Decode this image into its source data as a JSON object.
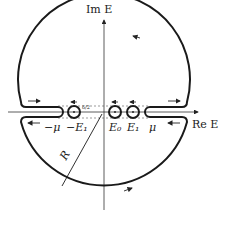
{
  "diagram": {
    "axes": {
      "imaginary_label": "Im E",
      "real_label": "Re E"
    },
    "points_labels": {
      "minus_mu": "−μ",
      "minus_E1": "−E₁",
      "E0": "E₀",
      "E1": "E₁",
      "mu": "μ"
    },
    "radius_label": "R",
    "gap_label": "δ/2",
    "colors": {
      "stroke": "#1a1a1a",
      "axis": "#333333",
      "dash": "#555555"
    }
  }
}
